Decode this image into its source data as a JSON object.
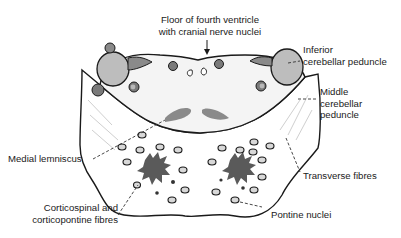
{
  "diagram": {
    "labels": {
      "floor_line1": "Floor of fourth ventricle",
      "floor_line2": "with cranial nerve nuclei",
      "icp_line1": "Inferior",
      "icp_line2": "cerebellar peduncle",
      "mcp_line1": "Middle",
      "mcp_line2": "cerebellar",
      "mcp_line3": "peduncle",
      "medial_lemniscus": "Medial lemniscus",
      "cs_line1": "Corticospinal and",
      "cs_line2": "corticopontine fibres",
      "transverse_fibres": "Transverse fibres",
      "pontine_nuclei": "Pontine nuclei"
    },
    "colors": {
      "outline": "#1a1a1a",
      "tegmentum_fill": "#f4f4f4",
      "peduncle_fill": "#bdbdbd",
      "dark_nucleus": "#6e6e6e",
      "lemniscus": "#8a8a8a",
      "tract": "#5a5a5a",
      "pontine_nucleus_fill": "#d8d8d8",
      "leader": "#333333"
    }
  }
}
